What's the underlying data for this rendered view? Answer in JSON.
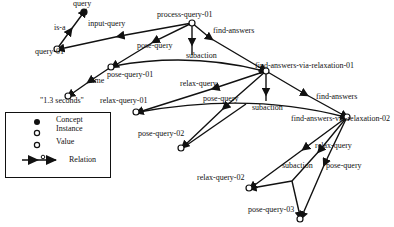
{
  "diagram": {
    "nodes": [
      {
        "id": "query",
        "label": "query",
        "kind": "concept",
        "x": 84,
        "y": 12
      },
      {
        "id": "query-01",
        "label": "query-01",
        "kind": "instance",
        "x": 57,
        "y": 49
      },
      {
        "id": "process-query-01",
        "label": "process-query-01",
        "kind": "instance",
        "x": 192,
        "y": 23
      },
      {
        "id": "pose-query-01",
        "label": "pose-query-01",
        "kind": "instance",
        "x": 111,
        "y": 67
      },
      {
        "id": "1.3-seconds",
        "label": "\"1.3 seconds\"",
        "kind": "value",
        "x": 68,
        "y": 96
      },
      {
        "id": "find-answers-via-relaxation-01",
        "label": "find-answers-via-relaxation-01",
        "kind": "instance",
        "x": 266,
        "y": 71
      },
      {
        "id": "relax-query-01",
        "label": "relax-query-01",
        "kind": "instance",
        "x": 136,
        "y": 112
      },
      {
        "id": "pose-query-02",
        "label": "pose-query-02",
        "kind": "instance",
        "x": 181,
        "y": 148
      },
      {
        "id": "find-answers-via-relaxation-02",
        "label": "find-answers-via-relaxation-02",
        "kind": "instance",
        "x": 347,
        "y": 117
      },
      {
        "id": "relax-query-02",
        "label": "relax-query-02",
        "kind": "instance",
        "x": 249,
        "y": 188
      },
      {
        "id": "pose-query-03",
        "label": "pose-query-03",
        "kind": "instance",
        "x": 300,
        "y": 219
      }
    ],
    "edge_labels": {
      "is_a": "is-a",
      "input_query": "input-query",
      "pose_query_1": "pose-query",
      "subaction_1": "subaction",
      "find_answers_1": "find-answers",
      "time": "time",
      "relax_query_1": "relax-query",
      "pose_query_2": "pose-query",
      "subaction_2": "subaction",
      "find_answers_2": "find-answers",
      "relax_query_2": "relax-query",
      "subaction_3": "subaction",
      "pose_query_3": "pose-query"
    },
    "labels": {
      "query": "query",
      "query_01": "query-01",
      "process_query_01": "process-query-01",
      "pose_query_01": "pose-query-01",
      "seconds": "\"1.3 seconds\"",
      "fav_01": "find-answers-via-relaxation-01",
      "relax_query_01": "relax-query-01",
      "pose_query_02": "pose-query-02",
      "fav_02": "find-answers-via-relaxation-02",
      "relax_query_02": "relax-query-02",
      "pose_query_03": "pose-query-03"
    }
  },
  "legend": {
    "concept": "Concept",
    "instance": "Instance",
    "value": "Value",
    "relation": "Relation"
  },
  "colors": {
    "ink": "#111111",
    "background": "#ffffff"
  }
}
